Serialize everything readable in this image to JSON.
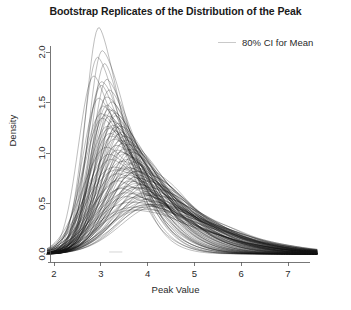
{
  "chart_data": {
    "type": "line",
    "title": "Bootstrap Replicates of the Distribution of the Peak",
    "xlabel": "Peak Value",
    "ylabel": "Density",
    "xlim": [
      1.85,
      7.65
    ],
    "ylim": [
      0.0,
      2.25
    ],
    "xticks": [
      2,
      3,
      4,
      5,
      6,
      7
    ],
    "xticklabels": [
      "2",
      "3",
      "4",
      "5",
      "6",
      "7"
    ],
    "yticks": [
      0.0,
      0.5,
      1.0,
      1.5,
      2.0
    ],
    "yticklabels": [
      "0.0",
      "0.5",
      "1.0",
      "1.5",
      "2.0"
    ],
    "grid": false,
    "legend": {
      "position": "top-right",
      "entries": [
        {
          "label": "80% CI for Mean",
          "color": "#c9c9c9"
        }
      ]
    },
    "series_description": "Approximately 100 overlaid bootstrap kernel density replicate curves of the peak value distribution, drawn as thin semi-transparent black lines; right-skewed with modes clustered between 2.9 and 3.6 and long right tails decaying to zero by about 5.5.",
    "series_style": {
      "color": "#121212",
      "width": 0.55,
      "opacity": 0.5
    },
    "n_replicates": 100,
    "replicates": [
      {
        "mode": 2.95,
        "peak_density": 2.2,
        "left_spread": 0.3,
        "right_spread": 0.52
      },
      {
        "mode": 3.02,
        "peak_density": 2.06,
        "left_spread": 0.31,
        "right_spread": 0.55
      },
      {
        "mode": 2.92,
        "peak_density": 1.92,
        "left_spread": 0.33,
        "right_spread": 0.58
      },
      {
        "mode": 3.08,
        "peak_density": 1.86,
        "left_spread": 0.32,
        "right_spread": 0.56
      },
      {
        "mode": 2.88,
        "peak_density": 1.8,
        "left_spread": 0.35,
        "right_spread": 0.6
      },
      {
        "mode": 3.14,
        "peak_density": 1.74,
        "left_spread": 0.34,
        "right_spread": 0.62
      },
      {
        "mode": 3.05,
        "peak_density": 1.7,
        "left_spread": 0.36,
        "right_spread": 0.6
      },
      {
        "mode": 2.99,
        "peak_density": 1.66,
        "left_spread": 0.35,
        "right_spread": 0.63
      },
      {
        "mode": 3.18,
        "peak_density": 1.62,
        "left_spread": 0.37,
        "right_spread": 0.64
      },
      {
        "mode": 3.1,
        "peak_density": 1.58,
        "left_spread": 0.36,
        "right_spread": 0.66
      },
      {
        "mode": 2.96,
        "peak_density": 1.55,
        "left_spread": 0.38,
        "right_spread": 0.65
      },
      {
        "mode": 3.22,
        "peak_density": 1.52,
        "left_spread": 0.37,
        "right_spread": 0.68
      },
      {
        "mode": 3.12,
        "peak_density": 1.5,
        "left_spread": 0.39,
        "right_spread": 0.67
      },
      {
        "mode": 3.04,
        "peak_density": 1.48,
        "left_spread": 0.38,
        "right_spread": 0.69
      },
      {
        "mode": 3.26,
        "peak_density": 1.46,
        "left_spread": 0.4,
        "right_spread": 0.7
      },
      {
        "mode": 3.16,
        "peak_density": 1.44,
        "left_spread": 0.39,
        "right_spread": 0.71
      },
      {
        "mode": 3.0,
        "peak_density": 1.42,
        "left_spread": 0.41,
        "right_spread": 0.7
      },
      {
        "mode": 3.3,
        "peak_density": 1.4,
        "left_spread": 0.4,
        "right_spread": 0.73
      },
      {
        "mode": 3.2,
        "peak_density": 1.38,
        "left_spread": 0.42,
        "right_spread": 0.72
      },
      {
        "mode": 3.08,
        "peak_density": 1.36,
        "left_spread": 0.41,
        "right_spread": 0.74
      },
      {
        "mode": 3.34,
        "peak_density": 1.35,
        "left_spread": 0.43,
        "right_spread": 0.75
      },
      {
        "mode": 3.24,
        "peak_density": 1.33,
        "left_spread": 0.42,
        "right_spread": 0.76
      },
      {
        "mode": 3.06,
        "peak_density": 1.32,
        "left_spread": 0.44,
        "right_spread": 0.74
      },
      {
        "mode": 3.38,
        "peak_density": 1.3,
        "left_spread": 0.43,
        "right_spread": 0.78
      },
      {
        "mode": 3.28,
        "peak_density": 1.29,
        "left_spread": 0.45,
        "right_spread": 0.77
      },
      {
        "mode": 3.12,
        "peak_density": 1.28,
        "left_spread": 0.44,
        "right_spread": 0.79
      },
      {
        "mode": 3.42,
        "peak_density": 1.26,
        "left_spread": 0.46,
        "right_spread": 0.8
      },
      {
        "mode": 3.32,
        "peak_density": 1.25,
        "left_spread": 0.45,
        "right_spread": 0.81
      },
      {
        "mode": 3.18,
        "peak_density": 1.24,
        "left_spread": 0.47,
        "right_spread": 0.79
      },
      {
        "mode": 3.46,
        "peak_density": 1.22,
        "left_spread": 0.46,
        "right_spread": 0.83
      },
      {
        "mode": 3.36,
        "peak_density": 1.21,
        "left_spread": 0.48,
        "right_spread": 0.82
      },
      {
        "mode": 3.22,
        "peak_density": 1.2,
        "left_spread": 0.47,
        "right_spread": 0.84
      },
      {
        "mode": 3.5,
        "peak_density": 1.18,
        "left_spread": 0.49,
        "right_spread": 0.85
      },
      {
        "mode": 3.4,
        "peak_density": 1.17,
        "left_spread": 0.48,
        "right_spread": 0.86
      },
      {
        "mode": 3.26,
        "peak_density": 1.16,
        "left_spread": 0.5,
        "right_spread": 0.84
      },
      {
        "mode": 3.54,
        "peak_density": 1.14,
        "left_spread": 0.49,
        "right_spread": 0.88
      },
      {
        "mode": 3.44,
        "peak_density": 1.13,
        "left_spread": 0.51,
        "right_spread": 0.87
      },
      {
        "mode": 3.3,
        "peak_density": 1.12,
        "left_spread": 0.5,
        "right_spread": 0.89
      },
      {
        "mode": 3.58,
        "peak_density": 1.1,
        "left_spread": 0.52,
        "right_spread": 0.9
      },
      {
        "mode": 3.48,
        "peak_density": 1.09,
        "left_spread": 0.51,
        "right_spread": 0.91
      },
      {
        "mode": 3.34,
        "peak_density": 1.08,
        "left_spread": 0.53,
        "right_spread": 0.89
      },
      {
        "mode": 3.62,
        "peak_density": 1.06,
        "left_spread": 0.52,
        "right_spread": 0.93
      },
      {
        "mode": 3.52,
        "peak_density": 1.05,
        "left_spread": 0.54,
        "right_spread": 0.92
      },
      {
        "mode": 3.38,
        "peak_density": 1.04,
        "left_spread": 0.53,
        "right_spread": 0.94
      },
      {
        "mode": 3.14,
        "peak_density": 1.03,
        "left_spread": 0.55,
        "right_spread": 0.92
      },
      {
        "mode": 3.66,
        "peak_density": 1.02,
        "left_spread": 0.54,
        "right_spread": 0.95
      },
      {
        "mode": 3.56,
        "peak_density": 1.0,
        "left_spread": 0.56,
        "right_spread": 0.94
      },
      {
        "mode": 3.42,
        "peak_density": 0.99,
        "left_spread": 0.55,
        "right_spread": 0.96
      },
      {
        "mode": 3.2,
        "peak_density": 0.98,
        "left_spread": 0.57,
        "right_spread": 0.95
      },
      {
        "mode": 3.7,
        "peak_density": 0.96,
        "left_spread": 0.56,
        "right_spread": 0.98
      },
      {
        "mode": 3.6,
        "peak_density": 0.95,
        "left_spread": 0.58,
        "right_spread": 0.97
      },
      {
        "mode": 3.46,
        "peak_density": 0.94,
        "left_spread": 0.57,
        "right_spread": 0.99
      },
      {
        "mode": 3.24,
        "peak_density": 0.93,
        "left_spread": 0.59,
        "right_spread": 0.97
      },
      {
        "mode": 3.74,
        "peak_density": 0.92,
        "left_spread": 0.58,
        "right_spread": 1.0
      },
      {
        "mode": 3.64,
        "peak_density": 0.9,
        "left_spread": 0.6,
        "right_spread": 0.99
      },
      {
        "mode": 3.5,
        "peak_density": 0.89,
        "left_spread": 0.59,
        "right_spread": 1.01
      },
      {
        "mode": 3.28,
        "peak_density": 0.88,
        "left_spread": 0.61,
        "right_spread": 1.0
      },
      {
        "mode": 3.78,
        "peak_density": 0.87,
        "left_spread": 0.6,
        "right_spread": 1.03
      },
      {
        "mode": 3.68,
        "peak_density": 0.86,
        "left_spread": 0.62,
        "right_spread": 1.02
      },
      {
        "mode": 3.54,
        "peak_density": 0.85,
        "left_spread": 0.61,
        "right_spread": 1.04
      },
      {
        "mode": 3.32,
        "peak_density": 0.84,
        "left_spread": 0.63,
        "right_spread": 1.02
      },
      {
        "mode": 3.82,
        "peak_density": 0.83,
        "left_spread": 0.62,
        "right_spread": 1.05
      },
      {
        "mode": 3.72,
        "peak_density": 0.82,
        "left_spread": 0.64,
        "right_spread": 1.04
      },
      {
        "mode": 3.58,
        "peak_density": 0.81,
        "left_spread": 0.63,
        "right_spread": 1.06
      },
      {
        "mode": 3.36,
        "peak_density": 0.8,
        "left_spread": 0.65,
        "right_spread": 1.05
      },
      {
        "mode": 3.86,
        "peak_density": 0.79,
        "left_spread": 0.64,
        "right_spread": 1.08
      },
      {
        "mode": 3.76,
        "peak_density": 0.78,
        "left_spread": 0.66,
        "right_spread": 1.07
      },
      {
        "mode": 3.62,
        "peak_density": 0.77,
        "left_spread": 0.65,
        "right_spread": 1.09
      },
      {
        "mode": 3.4,
        "peak_density": 0.76,
        "left_spread": 0.67,
        "right_spread": 1.07
      },
      {
        "mode": 3.9,
        "peak_density": 0.75,
        "left_spread": 0.66,
        "right_spread": 1.1
      },
      {
        "mode": 3.8,
        "peak_density": 0.74,
        "left_spread": 0.68,
        "right_spread": 1.09
      },
      {
        "mode": 3.66,
        "peak_density": 0.73,
        "left_spread": 0.67,
        "right_spread": 1.11
      },
      {
        "mode": 3.44,
        "peak_density": 0.72,
        "left_spread": 0.69,
        "right_spread": 1.1
      },
      {
        "mode": 3.94,
        "peak_density": 0.71,
        "left_spread": 0.68,
        "right_spread": 1.13
      },
      {
        "mode": 3.84,
        "peak_density": 0.7,
        "left_spread": 0.7,
        "right_spread": 1.12
      },
      {
        "mode": 3.7,
        "peak_density": 0.69,
        "left_spread": 0.69,
        "right_spread": 1.14
      },
      {
        "mode": 3.48,
        "peak_density": 0.68,
        "left_spread": 0.71,
        "right_spread": 1.12
      },
      {
        "mode": 3.98,
        "peak_density": 0.67,
        "left_spread": 0.7,
        "right_spread": 1.15
      },
      {
        "mode": 3.88,
        "peak_density": 0.66,
        "left_spread": 0.72,
        "right_spread": 1.14
      },
      {
        "mode": 3.74,
        "peak_density": 0.65,
        "left_spread": 0.71,
        "right_spread": 1.16
      },
      {
        "mode": 3.52,
        "peak_density": 0.64,
        "left_spread": 0.73,
        "right_spread": 1.15
      },
      {
        "mode": 4.02,
        "peak_density": 0.63,
        "left_spread": 0.72,
        "right_spread": 1.18
      },
      {
        "mode": 3.92,
        "peak_density": 0.62,
        "left_spread": 0.74,
        "right_spread": 1.17
      },
      {
        "mode": 3.78,
        "peak_density": 0.61,
        "left_spread": 0.73,
        "right_spread": 1.19
      },
      {
        "mode": 3.56,
        "peak_density": 0.6,
        "left_spread": 0.75,
        "right_spread": 1.17
      },
      {
        "mode": 4.06,
        "peak_density": 0.59,
        "left_spread": 0.74,
        "right_spread": 1.2
      },
      {
        "mode": 3.96,
        "peak_density": 0.58,
        "left_spread": 0.76,
        "right_spread": 1.19
      },
      {
        "mode": 3.82,
        "peak_density": 0.57,
        "left_spread": 0.75,
        "right_spread": 1.21
      },
      {
        "mode": 3.6,
        "peak_density": 0.56,
        "left_spread": 0.77,
        "right_spread": 1.2
      },
      {
        "mode": 4.1,
        "peak_density": 0.55,
        "left_spread": 0.76,
        "right_spread": 1.23
      },
      {
        "mode": 4.0,
        "peak_density": 0.54,
        "left_spread": 0.78,
        "right_spread": 1.22
      },
      {
        "mode": 3.86,
        "peak_density": 0.53,
        "left_spread": 0.77,
        "right_spread": 1.24
      },
      {
        "mode": 3.64,
        "peak_density": 0.52,
        "left_spread": 0.79,
        "right_spread": 1.22
      },
      {
        "mode": 4.14,
        "peak_density": 0.51,
        "left_spread": 0.78,
        "right_spread": 1.25
      },
      {
        "mode": 4.04,
        "peak_density": 0.5,
        "left_spread": 0.8,
        "right_spread": 1.24
      },
      {
        "mode": 3.9,
        "peak_density": 0.49,
        "left_spread": 0.79,
        "right_spread": 1.26
      },
      {
        "mode": 3.68,
        "peak_density": 0.48,
        "left_spread": 0.81,
        "right_spread": 1.25
      },
      {
        "mode": 4.18,
        "peak_density": 0.47,
        "left_spread": 0.8,
        "right_spread": 1.28
      },
      {
        "mode": 4.08,
        "peak_density": 0.46,
        "left_spread": 0.82,
        "right_spread": 1.27
      },
      {
        "mode": 3.94,
        "peak_density": 0.45,
        "left_spread": 0.81,
        "right_spread": 1.29
      },
      {
        "mode": 3.72,
        "peak_density": 0.44,
        "left_spread": 0.83,
        "right_spread": 1.27
      }
    ],
    "ci_band": {
      "lower": 3.18,
      "upper": 3.46,
      "peak_density": 0.02
    }
  }
}
